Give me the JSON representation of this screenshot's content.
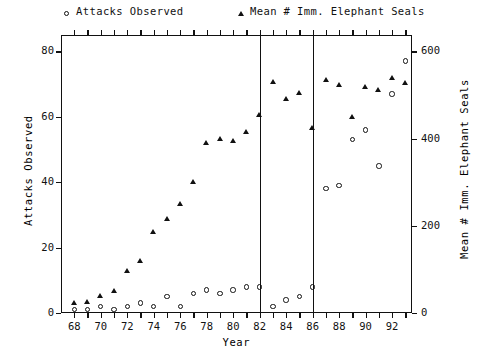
{
  "chart_data": {
    "type": "scatter",
    "title": "",
    "xlabel": "Year",
    "ylabel": "Attacks Observed",
    "y2label": "Mean # Imm. Elephant Seals",
    "xlim": [
      67.0,
      93.5
    ],
    "ylim": [
      0,
      85
    ],
    "y2lim": [
      0,
      637.5
    ],
    "grid": false,
    "legend_position": "top",
    "xticks": [
      68,
      69,
      70,
      71,
      72,
      73,
      74,
      75,
      76,
      77,
      78,
      79,
      80,
      81,
      82,
      83,
      84,
      85,
      86,
      87,
      88,
      89,
      90,
      91,
      92,
      93
    ],
    "xticklabels": [
      "68",
      "",
      "70",
      "",
      "72",
      "",
      "74",
      "",
      "76",
      "",
      "78",
      "",
      "80",
      "",
      "82",
      "",
      "84",
      "",
      "86",
      "",
      "88",
      "",
      "90",
      "",
      "92",
      ""
    ],
    "yticks": [
      0,
      20,
      40,
      60,
      80
    ],
    "yticklabels": [
      "0",
      "20",
      "40",
      "60",
      "80"
    ],
    "y2ticks": [
      0,
      200,
      400,
      600
    ],
    "y2ticklabels": [
      "0",
      "200",
      "400",
      "600"
    ],
    "annotations": [
      {
        "name": "vline-1982",
        "type": "vline",
        "x": 82.0
      },
      {
        "name": "vline-1986",
        "type": "vline",
        "x": 86.0
      }
    ],
    "series": [
      {
        "name": "Attacks Observed",
        "marker": "circle",
        "axis": "left",
        "color": "#111111",
        "points": [
          {
            "x": 68,
            "y": 1
          },
          {
            "x": 69,
            "y": 1
          },
          {
            "x": 70,
            "y": 2
          },
          {
            "x": 71,
            "y": 1
          },
          {
            "x": 72,
            "y": 2
          },
          {
            "x": 73,
            "y": 3
          },
          {
            "x": 74,
            "y": 2
          },
          {
            "x": 75,
            "y": 5
          },
          {
            "x": 76,
            "y": 2
          },
          {
            "x": 77,
            "y": 6
          },
          {
            "x": 78,
            "y": 7
          },
          {
            "x": 79,
            "y": 6
          },
          {
            "x": 80,
            "y": 7
          },
          {
            "x": 81,
            "y": 8
          },
          {
            "x": 82,
            "y": 8
          },
          {
            "x": 83,
            "y": 2
          },
          {
            "x": 84,
            "y": 4
          },
          {
            "x": 85,
            "y": 5
          },
          {
            "x": 86,
            "y": 8
          },
          {
            "x": 87,
            "y": 38
          },
          {
            "x": 88,
            "y": 39
          },
          {
            "x": 89,
            "y": 53
          },
          {
            "x": 90,
            "y": 56
          },
          {
            "x": 91,
            "y": 45
          },
          {
            "x": 92,
            "y": 67
          },
          {
            "x": 93,
            "y": 77
          }
        ]
      },
      {
        "name": "Mean # Imm. Elephant Seals",
        "marker": "triangle",
        "axis": "right",
        "color": "#111111",
        "points": [
          {
            "x": 68,
            "y": 22
          },
          {
            "x": 69,
            "y": 25
          },
          {
            "x": 70,
            "y": 38
          },
          {
            "x": 71,
            "y": 50
          },
          {
            "x": 72,
            "y": 97
          },
          {
            "x": 73,
            "y": 120
          },
          {
            "x": 74,
            "y": 185
          },
          {
            "x": 75,
            "y": 215
          },
          {
            "x": 76,
            "y": 250
          },
          {
            "x": 77,
            "y": 300
          },
          {
            "x": 78,
            "y": 390
          },
          {
            "x": 79,
            "y": 400
          },
          {
            "x": 80,
            "y": 395
          },
          {
            "x": 81,
            "y": 415
          },
          {
            "x": 82,
            "y": 455
          },
          {
            "x": 83,
            "y": 530
          },
          {
            "x": 84,
            "y": 490
          },
          {
            "x": 85,
            "y": 505
          },
          {
            "x": 86,
            "y": 425
          },
          {
            "x": 87,
            "y": 535
          },
          {
            "x": 88,
            "y": 522
          },
          {
            "x": 89,
            "y": 450
          },
          {
            "x": 90,
            "y": 518
          },
          {
            "x": 91,
            "y": 512
          },
          {
            "x": 92,
            "y": 540
          },
          {
            "x": 93,
            "y": 528
          }
        ]
      }
    ]
  },
  "legend": {
    "entries": [
      {
        "label": "Attacks Observed",
        "marker": "circle",
        "name": "legend-attacks-observed"
      },
      {
        "label": "Mean # Imm. Elephant Seals",
        "marker": "triangle",
        "name": "legend-mean-imm-elephant-seals"
      }
    ]
  },
  "axes": {
    "left_title": "Attacks Observed",
    "right_title": "Mean # Imm. Elephant Seals",
    "bottom_title": "Year"
  }
}
